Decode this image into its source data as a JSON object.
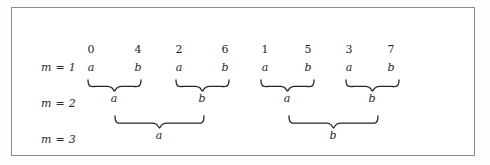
{
  "figure": {
    "frame": {
      "border_color": "#8b8b8b",
      "background": "#ffffff"
    },
    "row_labels": [
      {
        "text": "m = 1"
      },
      {
        "text": "m = 2"
      },
      {
        "text": "m = 3"
      }
    ],
    "columns": {
      "indices": [
        "0",
        "4",
        "2",
        "6",
        "1",
        "5",
        "3",
        "7"
      ],
      "letters": [
        "a",
        "b",
        "a",
        "b",
        "a",
        "b",
        "a",
        "b"
      ],
      "x_positions": [
        90,
        137,
        178,
        224,
        264,
        307,
        348,
        390
      ]
    },
    "level2_groups": [
      {
        "label": "a",
        "start_x": 86,
        "end_x": 141,
        "center_x": 113
      },
      {
        "label": "b",
        "start_x": 174,
        "end_x": 229,
        "center_x": 201
      },
      {
        "label": "a",
        "start_x": 259,
        "end_x": 314,
        "center_x": 286
      },
      {
        "label": "b",
        "start_x": 344,
        "end_x": 399,
        "center_x": 371
      }
    ],
    "level3_groups": [
      {
        "label": "a",
        "start_x": 113,
        "end_x": 204,
        "center_x": 158
      },
      {
        "label": "b",
        "start_x": 287,
        "end_x": 378,
        "center_x": 332
      }
    ],
    "colors": {
      "text": "#1f1f1f",
      "brace": "#262626",
      "border": "#8b8b8b"
    }
  }
}
